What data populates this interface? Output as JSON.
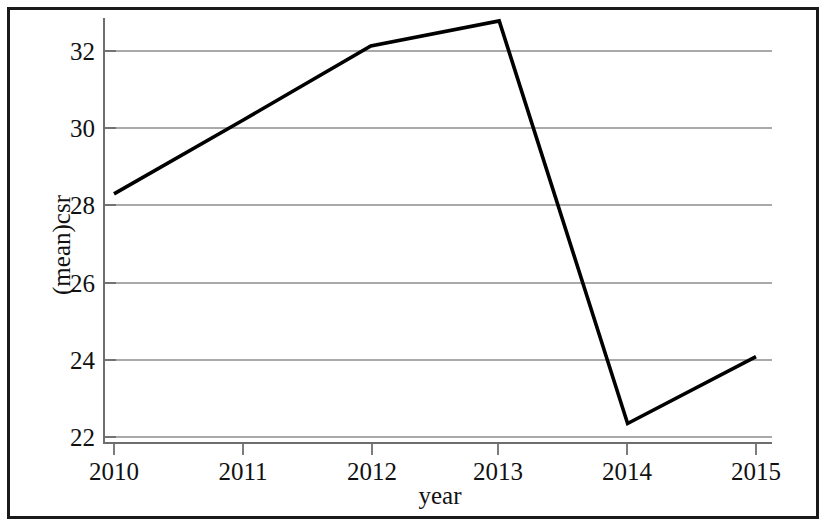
{
  "figure": {
    "background_color": "#ffffff",
    "frame_color": "#1a1a1a",
    "line_color": "#000000",
    "grid_color": "#8c8c8c",
    "axis_color": "#6e6e6e"
  },
  "chart_data": {
    "type": "line",
    "title": "",
    "subtitle": "",
    "xlabel": "year",
    "ylabel": "(mean)csr",
    "x": [
      2010,
      2011,
      2012,
      2013,
      2014,
      2015
    ],
    "xtick_labels": [
      "2010",
      "2011",
      "2012",
      "2013",
      "2014",
      "2015"
    ],
    "ytick_labels": [
      "22",
      "24",
      "26",
      "28",
      "30",
      "32"
    ],
    "ytick_values": [
      22,
      24,
      26,
      28,
      30,
      32
    ],
    "xlim": [
      2010,
      2015
    ],
    "ylim": [
      21.6,
      33.1
    ],
    "grid": true,
    "grid_axis": "y",
    "legend": false,
    "legend_position": "none",
    "series": [
      {
        "name": "(mean)csr",
        "values": [
          28.3,
          30.2,
          32.13,
          32.78,
          22.35,
          24.08
        ]
      }
    ]
  },
  "axes": {
    "x_axis_title": "year",
    "y_axis_title": "(mean)csr"
  }
}
